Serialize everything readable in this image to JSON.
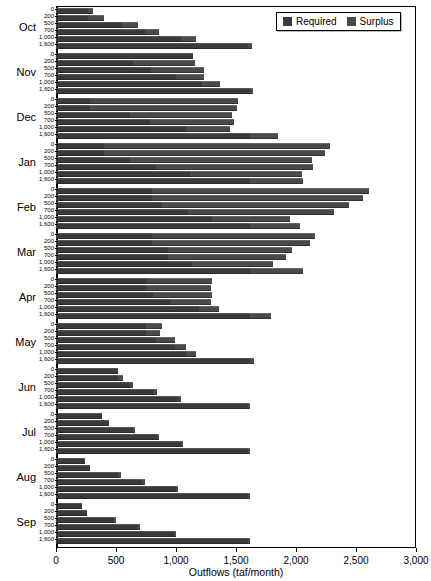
{
  "chart_data": {
    "type": "bar",
    "orientation": "horizontal",
    "stacked": true,
    "title": "",
    "xlabel": "Outflows (taf/month)",
    "ylabel": "",
    "xlim": [
      0,
      3000
    ],
    "xticks": [
      0,
      500,
      1000,
      1500,
      2000,
      2500,
      3000
    ],
    "xticklabels": [
      "0",
      "500",
      "1,000",
      "1,500",
      "2,000",
      "2,500",
      "3,000"
    ],
    "grid": false,
    "legend": {
      "position": "top-right",
      "entries": [
        {
          "name": "Required",
          "color": "#3a3a3a"
        },
        {
          "name": "Surplus",
          "color": "#4a4a4a"
        }
      ]
    },
    "group_labels": [
      "Oct",
      "Nov",
      "Dec",
      "Jan",
      "Feb",
      "Mar",
      "Apr",
      "May",
      "Jun",
      "Jul",
      "Aug",
      "Sep"
    ],
    "subcategories": [
      "0",
      "200",
      "500",
      "700",
      "1,000",
      "1,600"
    ],
    "series": [
      {
        "name": "Required",
        "color": "#3a3a3a"
      },
      {
        "name": "Surplus",
        "color": "#4a4a4a"
      }
    ],
    "groups": [
      {
        "label": "Oct",
        "bars": [
          {
            "sub": "0",
            "required": 270,
            "surplus": 40
          },
          {
            "sub": "200",
            "required": 270,
            "surplus": 130
          },
          {
            "sub": "500",
            "required": 550,
            "surplus": 130
          },
          {
            "sub": "700",
            "required": 740,
            "surplus": 120
          },
          {
            "sub": "1,000",
            "required": 1040,
            "surplus": 130
          },
          {
            "sub": "1,600",
            "required": 1600,
            "surplus": 30
          }
        ]
      },
      {
        "label": "Nov",
        "bars": [
          {
            "sub": "0",
            "required": 1140,
            "surplus": 0
          },
          {
            "sub": "200",
            "required": 640,
            "surplus": 520
          },
          {
            "sub": "500",
            "required": 790,
            "surplus": 440
          },
          {
            "sub": "700",
            "required": 1000,
            "surplus": 230
          },
          {
            "sub": "1,000",
            "required": 1220,
            "surplus": 150
          },
          {
            "sub": "1,600",
            "required": 1620,
            "surplus": 20
          }
        ]
      },
      {
        "label": "Dec",
        "bars": [
          {
            "sub": "0",
            "required": 280,
            "surplus": 1240
          },
          {
            "sub": "200",
            "required": 280,
            "surplus": 1230
          },
          {
            "sub": "500",
            "required": 620,
            "surplus": 850
          },
          {
            "sub": "700",
            "required": 780,
            "surplus": 700
          },
          {
            "sub": "1,000",
            "required": 1080,
            "surplus": 370
          },
          {
            "sub": "1,600",
            "required": 1620,
            "surplus": 230
          }
        ]
      },
      {
        "label": "Jan",
        "bars": [
          {
            "sub": "0",
            "required": 400,
            "surplus": 1880
          },
          {
            "sub": "200",
            "required": 400,
            "surplus": 1840
          },
          {
            "sub": "500",
            "required": 620,
            "surplus": 1510
          },
          {
            "sub": "700",
            "required": 830,
            "surplus": 1310
          },
          {
            "sub": "1,000",
            "required": 1120,
            "surplus": 930
          },
          {
            "sub": "1,600",
            "required": 1620,
            "surplus": 440
          }
        ]
      },
      {
        "label": "Feb",
        "bars": [
          {
            "sub": "0",
            "required": 800,
            "surplus": 1810
          },
          {
            "sub": "200",
            "required": 800,
            "surplus": 1760
          },
          {
            "sub": "500",
            "required": 880,
            "surplus": 1560
          },
          {
            "sub": "700",
            "required": 1100,
            "surplus": 1220
          },
          {
            "sub": "1,000",
            "required": 1300,
            "surplus": 650
          },
          {
            "sub": "1,600",
            "required": 1620,
            "surplus": 410
          }
        ]
      },
      {
        "label": "Mar",
        "bars": [
          {
            "sub": "0",
            "required": 800,
            "surplus": 1360
          },
          {
            "sub": "200",
            "required": 800,
            "surplus": 1320
          },
          {
            "sub": "500",
            "required": 930,
            "surplus": 1040
          },
          {
            "sub": "700",
            "required": 930,
            "surplus": 990
          },
          {
            "sub": "1,000",
            "required": 1130,
            "surplus": 680
          },
          {
            "sub": "1,600",
            "required": 1620,
            "surplus": 440
          }
        ]
      },
      {
        "label": "Apr",
        "bars": [
          {
            "sub": "0",
            "required": 760,
            "surplus": 540
          },
          {
            "sub": "200",
            "required": 760,
            "surplus": 530
          },
          {
            "sub": "500",
            "required": 810,
            "surplus": 490
          },
          {
            "sub": "700",
            "required": 960,
            "surplus": 330
          },
          {
            "sub": "1,000",
            "required": 1190,
            "surplus": 170
          },
          {
            "sub": "1,600",
            "required": 1620,
            "surplus": 170
          }
        ]
      },
      {
        "label": "May",
        "bars": [
          {
            "sub": "0",
            "required": 750,
            "surplus": 130
          },
          {
            "sub": "200",
            "required": 750,
            "surplus": 120
          },
          {
            "sub": "500",
            "required": 830,
            "surplus": 160
          },
          {
            "sub": "700",
            "required": 990,
            "surplus": 90
          },
          {
            "sub": "1,000",
            "required": 1080,
            "surplus": 90
          },
          {
            "sub": "1,600",
            "required": 1620,
            "surplus": 30
          }
        ]
      },
      {
        "label": "Jun",
        "bars": [
          {
            "sub": "0",
            "required": 520,
            "surplus": 0
          },
          {
            "sub": "200",
            "required": 520,
            "surplus": 40
          },
          {
            "sub": "500",
            "required": 620,
            "surplus": 20
          },
          {
            "sub": "700",
            "required": 820,
            "surplus": 20
          },
          {
            "sub": "1,000",
            "required": 1020,
            "surplus": 20
          },
          {
            "sub": "1,600",
            "required": 1600,
            "surplus": 20
          }
        ]
      },
      {
        "label": "Jul",
        "bars": [
          {
            "sub": "0",
            "required": 380,
            "surplus": 0
          },
          {
            "sub": "200",
            "required": 440,
            "surplus": 0
          },
          {
            "sub": "500",
            "required": 640,
            "surplus": 20
          },
          {
            "sub": "700",
            "required": 840,
            "surplus": 20
          },
          {
            "sub": "1,000",
            "required": 1040,
            "surplus": 20
          },
          {
            "sub": "1,600",
            "required": 1600,
            "surplus": 20
          }
        ]
      },
      {
        "label": "Aug",
        "bars": [
          {
            "sub": "0",
            "required": 240,
            "surplus": 0
          },
          {
            "sub": "200",
            "required": 280,
            "surplus": 0
          },
          {
            "sub": "500",
            "required": 520,
            "surplus": 20
          },
          {
            "sub": "700",
            "required": 720,
            "surplus": 20
          },
          {
            "sub": "1,000",
            "required": 1000,
            "surplus": 20
          },
          {
            "sub": "1,600",
            "required": 1600,
            "surplus": 20
          }
        ]
      },
      {
        "label": "Sep",
        "bars": [
          {
            "sub": "0",
            "required": 220,
            "surplus": 0
          },
          {
            "sub": "200",
            "required": 260,
            "surplus": 0
          },
          {
            "sub": "500",
            "required": 480,
            "surplus": 20
          },
          {
            "sub": "700",
            "required": 680,
            "surplus": 20
          },
          {
            "sub": "1,000",
            "required": 980,
            "surplus": 20
          },
          {
            "sub": "1,600",
            "required": 1600,
            "surplus": 20
          }
        ]
      }
    ]
  }
}
